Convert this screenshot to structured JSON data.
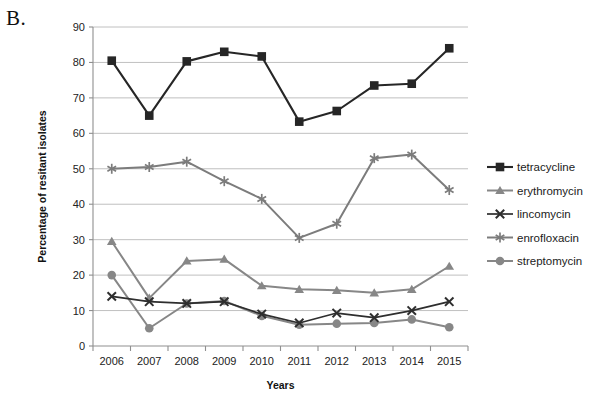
{
  "panel": {
    "label": "B."
  },
  "chart_data": {
    "type": "line",
    "title": "",
    "xlabel": "Years",
    "ylabel": "Percentage of resitant isolates",
    "categories": [
      "2006",
      "2007",
      "2008",
      "2009",
      "2010",
      "2011",
      "2012",
      "2013",
      "2014",
      "2015"
    ],
    "x": [
      2006,
      2007,
      2008,
      2009,
      2010,
      2011,
      2012,
      2013,
      2014,
      2015
    ],
    "ylim": [
      0,
      90
    ],
    "ytick_labels": [
      "0",
      "10",
      "20",
      "30",
      "40",
      "50",
      "60",
      "70",
      "80",
      "90"
    ],
    "ytick_values": [
      0,
      10,
      20,
      30,
      40,
      50,
      60,
      70,
      80,
      90
    ],
    "grid": "horizontal",
    "legend_position": "right",
    "series": [
      {
        "name": "tetracycline",
        "marker": "square",
        "color": "#262626",
        "line_width": 2.1,
        "values": [
          80.5,
          65.0,
          80.3,
          83.0,
          81.7,
          63.3,
          66.3,
          73.5,
          74.0,
          84.0
        ]
      },
      {
        "name": "erythromycin",
        "marker": "triangle",
        "color": "#878787",
        "line_width": 2.0,
        "values": [
          29.5,
          13.5,
          24.0,
          24.5,
          17.0,
          16.0,
          15.7,
          15.0,
          16.0,
          22.5
        ]
      },
      {
        "name": "lincomycin",
        "marker": "cross",
        "color": "#2e2e2e",
        "line_width": 1.7,
        "values": [
          14.0,
          12.5,
          12.0,
          12.5,
          9.0,
          6.5,
          9.3,
          8.0,
          10.0,
          12.5
        ]
      },
      {
        "name": "enrofloxacin",
        "marker": "asterisk",
        "color": "#7c7c7c",
        "line_width": 2.0,
        "values": [
          50.0,
          50.5,
          52.0,
          46.5,
          41.5,
          30.5,
          34.5,
          53.0,
          54.0,
          44.0
        ]
      },
      {
        "name": "streptomycin",
        "marker": "circle",
        "color": "#878787",
        "line_width": 2.0,
        "values": [
          20.0,
          5.0,
          12.0,
          12.7,
          8.5,
          6.0,
          6.3,
          6.5,
          7.5,
          5.3
        ]
      }
    ]
  }
}
